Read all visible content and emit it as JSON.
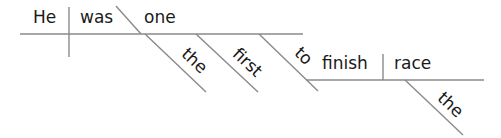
{
  "diagram": {
    "type": "sentence-diagram",
    "sentence": "He was one the first to finish the race",
    "words": {
      "subject": "He",
      "verb": "was",
      "predicate_nominative": "one",
      "modifier_the_1": "the",
      "modifier_first": "first",
      "infinitive_marker": "to",
      "infinitive_verb": "finish",
      "object": "race",
      "modifier_the_2": "the"
    },
    "line_color": "#8a8a8a",
    "text_color": "#1a1a1a"
  }
}
